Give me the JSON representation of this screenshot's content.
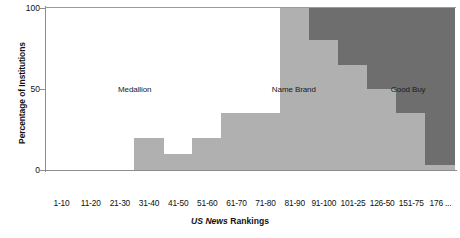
{
  "chart_data": {
    "type": "area",
    "title": "",
    "xlabel_italic": "US News",
    "xlabel_bold": "Rankings",
    "xlabel": "US News Rankings",
    "ylabel": "Percentage of Institutions",
    "ylim": [
      0,
      100
    ],
    "yticks": [
      0,
      50,
      100
    ],
    "ytick_labels": [
      "0",
      "50",
      "100"
    ],
    "xlim_note": "categorical ordered rank bins",
    "grid": false,
    "legend_position": "inline-annotations",
    "categories": [
      "1-10",
      "11-20",
      "21-30",
      "31-40",
      "41-50",
      "51-60",
      "61-70",
      "71-80",
      "81-90",
      "91-100",
      "101-25",
      "126-50",
      "151-75",
      "176 ..."
    ],
    "series": [
      {
        "name": "Medallion",
        "color": "#ffffff",
        "values": [
          100,
          100,
          100,
          80,
          90,
          80,
          65,
          65,
          0,
          0,
          0,
          0,
          0,
          0
        ]
      },
      {
        "name": "Name Brand",
        "color": "#b0b0b0",
        "values": [
          0,
          0,
          0,
          20,
          10,
          20,
          35,
          35,
          100,
          80,
          65,
          50,
          35,
          3
        ]
      },
      {
        "name": "Good Buy",
        "color": "#6e6e6e",
        "values": [
          0,
          0,
          0,
          0,
          0,
          0,
          0,
          0,
          0,
          20,
          35,
          50,
          65,
          97
        ]
      }
    ],
    "annotations": [
      {
        "text": "Medallion",
        "x_frac": 0.215,
        "y_frac": 0.5,
        "on_dark": false
      },
      {
        "text": "Name Brand",
        "x_frac": 0.605,
        "y_frac": 0.5,
        "on_dark": false
      },
      {
        "text": "Good Buy",
        "x_frac": 0.885,
        "y_frac": 0.5,
        "on_dark": false
      }
    ]
  },
  "axis": {
    "y_title": "Percentage of Institutions",
    "x_title_part1": "US News",
    "x_title_part2": "Rankings"
  }
}
